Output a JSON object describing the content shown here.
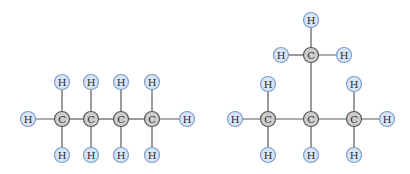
{
  "colors": {
    "background": "#ffffff",
    "bond": "#5a5a5a",
    "carbon_fill": "#cdcdcd",
    "carbon_stroke": "#555555",
    "hydrogen_fill": "#d6e6f8",
    "hydrogen_stroke": "#7b9ccb",
    "label": "#2b2b2b"
  },
  "atom_radius": 7.5,
  "molecules": [
    {
      "name": "butane",
      "atoms": [
        {
          "id": "C1",
          "el": "C",
          "x": 62,
          "y": 119
        },
        {
          "id": "C2",
          "el": "C",
          "x": 91,
          "y": 119
        },
        {
          "id": "C3",
          "el": "C",
          "x": 121,
          "y": 119
        },
        {
          "id": "C4",
          "el": "C",
          "x": 152,
          "y": 119
        },
        {
          "id": "H1",
          "el": "H",
          "x": 28,
          "y": 119
        },
        {
          "id": "H2",
          "el": "H",
          "x": 187,
          "y": 119
        },
        {
          "id": "H3",
          "el": "H",
          "x": 62,
          "y": 82
        },
        {
          "id": "H4",
          "el": "H",
          "x": 91,
          "y": 82
        },
        {
          "id": "H5",
          "el": "H",
          "x": 121,
          "y": 82
        },
        {
          "id": "H6",
          "el": "H",
          "x": 152,
          "y": 82
        },
        {
          "id": "H7",
          "el": "H",
          "x": 62,
          "y": 155
        },
        {
          "id": "H8",
          "el": "H",
          "x": 91,
          "y": 155
        },
        {
          "id": "H9",
          "el": "H",
          "x": 121,
          "y": 155
        },
        {
          "id": "H10",
          "el": "H",
          "x": 152,
          "y": 155
        }
      ],
      "bonds": [
        [
          "H1",
          "C1"
        ],
        [
          "C1",
          "C2"
        ],
        [
          "C2",
          "C3"
        ],
        [
          "C3",
          "C4"
        ],
        [
          "C4",
          "H2"
        ],
        [
          "C1",
          "H3"
        ],
        [
          "C2",
          "H4"
        ],
        [
          "C3",
          "H5"
        ],
        [
          "C4",
          "H6"
        ],
        [
          "C1",
          "H7"
        ],
        [
          "C2",
          "H8"
        ],
        [
          "C3",
          "H9"
        ],
        [
          "C4",
          "H10"
        ]
      ]
    },
    {
      "name": "isobutane",
      "atoms": [
        {
          "id": "C1",
          "el": "C",
          "x": 268,
          "y": 119
        },
        {
          "id": "C2",
          "el": "C",
          "x": 311,
          "y": 119
        },
        {
          "id": "C3",
          "el": "C",
          "x": 354,
          "y": 119
        },
        {
          "id": "C4",
          "el": "C",
          "x": 311,
          "y": 55
        },
        {
          "id": "H1",
          "el": "H",
          "x": 235,
          "y": 119
        },
        {
          "id": "H2",
          "el": "H",
          "x": 387,
          "y": 119
        },
        {
          "id": "H3",
          "el": "H",
          "x": 268,
          "y": 84
        },
        {
          "id": "H4",
          "el": "H",
          "x": 354,
          "y": 84
        },
        {
          "id": "H5",
          "el": "H",
          "x": 268,
          "y": 155
        },
        {
          "id": "H6",
          "el": "H",
          "x": 311,
          "y": 155
        },
        {
          "id": "H7",
          "el": "H",
          "x": 354,
          "y": 155
        },
        {
          "id": "H8",
          "el": "H",
          "x": 311,
          "y": 20
        },
        {
          "id": "H9",
          "el": "H",
          "x": 281,
          "y": 55
        },
        {
          "id": "H10",
          "el": "H",
          "x": 344,
          "y": 55
        }
      ],
      "bonds": [
        [
          "H1",
          "C1"
        ],
        [
          "C1",
          "C2"
        ],
        [
          "C2",
          "C3"
        ],
        [
          "C3",
          "H2"
        ],
        [
          "C1",
          "H3"
        ],
        [
          "C3",
          "H4"
        ],
        [
          "C1",
          "H5"
        ],
        [
          "C2",
          "H6"
        ],
        [
          "C3",
          "H7"
        ],
        [
          "C2",
          "C4"
        ],
        [
          "C4",
          "H8"
        ],
        [
          "C4",
          "H9"
        ],
        [
          "C4",
          "H10"
        ]
      ]
    }
  ]
}
